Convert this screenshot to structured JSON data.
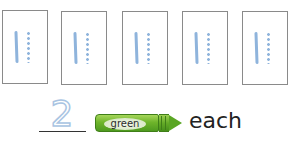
{
  "cards": [
    {
      "solid_tallies": 1,
      "dotted_tallies": 1
    },
    {
      "solid_tallies": 1,
      "dotted_tallies": 1
    },
    {
      "solid_tallies": 1,
      "dotted_tallies": 1
    },
    {
      "solid_tallies": 1,
      "dotted_tallies": 1
    },
    {
      "solid_tallies": 1,
      "dotted_tallies": 1
    }
  ],
  "answer": {
    "value": "2"
  },
  "crayon": {
    "label": "green",
    "color": "#6fb52b"
  },
  "suffix": "each",
  "colors": {
    "tally": "#8fb4dc",
    "card_border": "#8a8a8a"
  }
}
